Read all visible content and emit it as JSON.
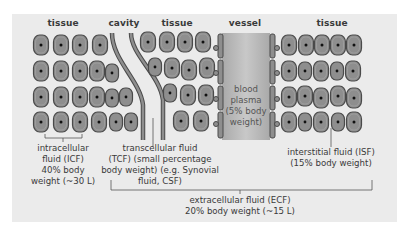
{
  "diagram": {
    "region_labels": [
      {
        "id": "tissue-left",
        "text": "tissue",
        "x": 63
      },
      {
        "id": "cavity",
        "text": "cavity",
        "x": 124
      },
      {
        "id": "tissue-middle",
        "text": "tissue",
        "x": 177
      },
      {
        "id": "vessel",
        "text": "vessel",
        "x": 245
      },
      {
        "id": "tissue-right",
        "text": "tissue",
        "x": 332
      }
    ],
    "vessel_content": {
      "lines": [
        "blood",
        "plasma",
        "(5% body",
        "weight)"
      ]
    },
    "annotations": {
      "icf": {
        "lines": [
          "intracellular",
          "fluid (ICF)",
          "40% body",
          "weight (~30 L)"
        ]
      },
      "tcf": {
        "lines": [
          "transcellular fluid",
          "(TCF) (small percentage",
          "body weight) (e.g. Synovial",
          "fluid, CSF)"
        ]
      },
      "isf": {
        "lines": [
          "interstitial fluid (ISF)",
          "(15% body weight)"
        ]
      },
      "ecf": {
        "lines": [
          "extracellular fluid (ECF)",
          "20% body weight (~15 L)"
        ]
      }
    },
    "colors": {
      "panel_bg": "#ebebeb",
      "cell_fill": "#8e8e8e",
      "cell_stroke": "#4a4a4a",
      "nucleus": "#111111",
      "vessel_plasma": "#b5b5b5",
      "text": "#3a3a3a"
    }
  }
}
